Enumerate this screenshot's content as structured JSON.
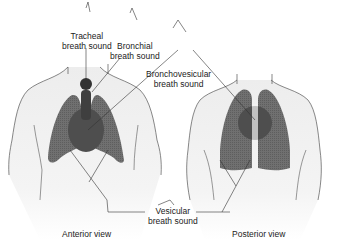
{
  "diagram": {
    "colors": {
      "lung": "#6b6b6b",
      "lung_hatch": "#5a5a5a",
      "bronchovesicular": "#4a4a4a",
      "bronchial": "#3f3f3f",
      "trachea": "#333333",
      "body_fill_top": "#f2f2f2",
      "body_fill_bottom": "#ffffff",
      "outline": "#555555",
      "leader": "#333333"
    },
    "labels": {
      "tracheal": [
        "Tracheal",
        "breath sound"
      ],
      "bronchial": [
        "Bronchial",
        "breath sound"
      ],
      "bronchovesicular": [
        "Bronchovesicular",
        "breath sound"
      ],
      "vesicular": [
        "Vesicular",
        "breath sound"
      ],
      "anterior": "Anterior view",
      "posterior": "Posterior view"
    }
  }
}
